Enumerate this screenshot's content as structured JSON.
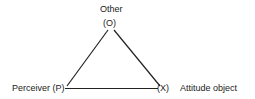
{
  "diagram": {
    "type": "triangle",
    "nodes": {
      "top": {
        "title": "Other",
        "label": "(O)"
      },
      "left": {
        "label": "Perceiver (P)"
      },
      "right": {
        "label": "(X)",
        "description": "Attitude object"
      }
    },
    "edges": [
      {
        "from": "O",
        "to": "P"
      },
      {
        "from": "O",
        "to": "X"
      },
      {
        "from": "P",
        "to": "X"
      }
    ],
    "line_color": "#222222"
  }
}
